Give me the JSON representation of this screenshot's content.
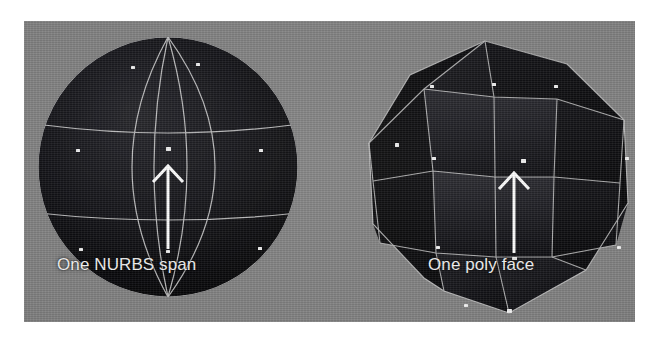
{
  "figure": {
    "kind": "3d-viewport-comparison-figure",
    "background_color": "#ffffff",
    "viewport_color": "#818181"
  },
  "viewport": {
    "label": "3D viewport",
    "background_color": "#818181"
  },
  "models": [
    {
      "id": "nurbs-sphere",
      "name": "NURBS sphere",
      "surface_color": "#0d0d0f",
      "wireframe_color": "#e8e8e8",
      "vertex_color": "#f5f5f5",
      "caption": "One NURBS span",
      "annotation_arrow": "up-arrow",
      "arrow_color": "#ffffff"
    },
    {
      "id": "poly-sphere",
      "name": "Polygon sphere",
      "surface_color": "#0b0b0d",
      "wireframe_color": "#d8d8d8",
      "vertex_color": "#f5f5f5",
      "caption": "One poly face",
      "annotation_arrow": "up-arrow",
      "arrow_color": "#ffffff"
    }
  ],
  "captions": {
    "nurbs": "One NURBS span",
    "poly": "One poly face"
  }
}
